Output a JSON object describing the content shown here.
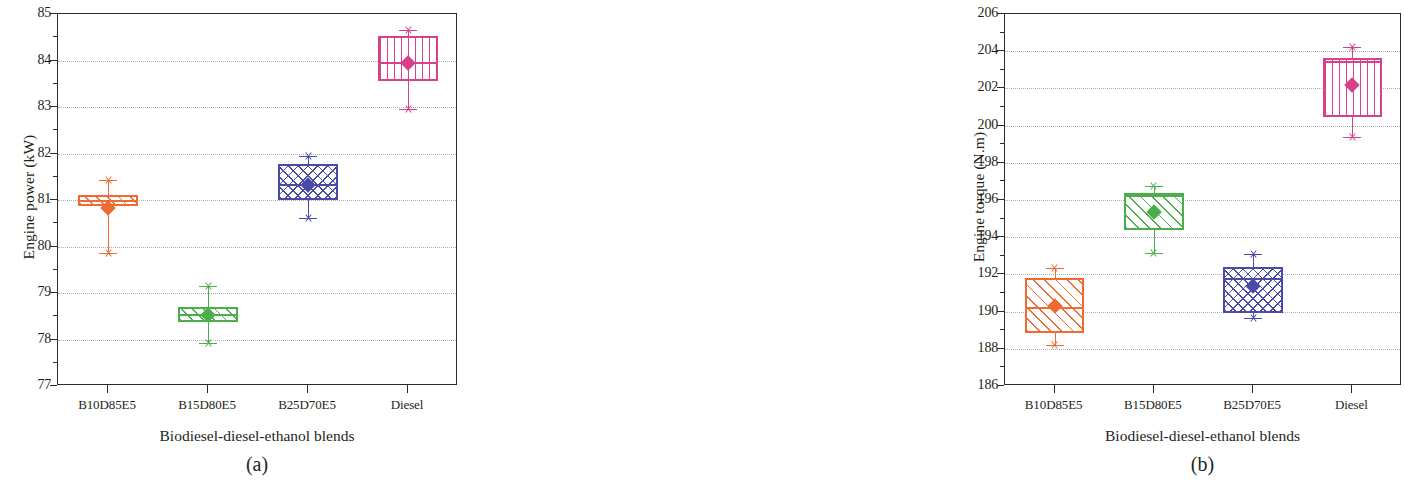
{
  "figure": {
    "panels": [
      {
        "caption": "(a)",
        "xlabel": "Biodiesel-diesel-ethanol blends",
        "ylabel": "Engine power (kW)"
      },
      {
        "caption": "(b)",
        "xlabel": "Biodiesel-diesel-ethanol blends",
        "ylabel": "Engine torque (N.m)"
      }
    ]
  },
  "colors": {
    "orange": "#ee6b33",
    "green": "#4aaf4a",
    "blue": "#4a4aa8",
    "pink": "#d6418a",
    "axis": "#2b2b2b",
    "grid": "#9aa3ad"
  },
  "chart_data": [
    {
      "type": "box",
      "title": "(a)",
      "xlabel": "Biodiesel-diesel-ethanol blends",
      "ylabel": "Engine power (kW)",
      "ylim": [
        77,
        85
      ],
      "yticks": [
        77,
        78,
        79,
        80,
        81,
        82,
        83,
        84,
        85
      ],
      "ytick_labels": [
        "77",
        "78",
        "79",
        "80",
        "81",
        "82",
        "83",
        "84",
        "85"
      ],
      "grid": true,
      "legend": "none",
      "categories": [
        "B10D85E5",
        "B15D80E5",
        "B25D70E5",
        "Diesel"
      ],
      "boxes": [
        {
          "category": "B10D85E5",
          "color": "#ee6b33",
          "hatch": "diagonal-right",
          "whisker_low": 79.85,
          "q1": 80.88,
          "median": 81.0,
          "mean": 80.82,
          "q3": 81.1,
          "whisker_high": 81.43
        },
        {
          "category": "B15D80E5",
          "color": "#4aaf4a",
          "hatch": "diagonal-right",
          "whisker_low": 77.92,
          "q1": 78.37,
          "median": 78.55,
          "mean": 78.53,
          "q3": 78.69,
          "whisker_high": 79.14
        },
        {
          "category": "B25D70E5",
          "color": "#4a4aa8",
          "hatch": "crosshatch",
          "whisker_low": 80.62,
          "q1": 81.0,
          "median": 81.35,
          "mean": 81.32,
          "q3": 81.77,
          "whisker_high": 81.95
        },
        {
          "category": "Diesel",
          "color": "#d6418a",
          "hatch": "vertical",
          "whisker_low": 82.96,
          "q1": 83.55,
          "median": 83.97,
          "mean": 83.95,
          "q3": 84.52,
          "whisker_high": 84.66
        }
      ]
    },
    {
      "type": "box",
      "title": "(b)",
      "xlabel": "Biodiesel-diesel-ethanol blends",
      "ylabel": "Engine torque (N.m)",
      "ylim": [
        186,
        206
      ],
      "yticks": [
        186,
        188,
        190,
        192,
        194,
        196,
        198,
        200,
        202,
        204,
        206
      ],
      "ytick_labels": [
        "186",
        "188",
        "190",
        "192",
        "194",
        "196",
        "198",
        "200",
        "202",
        "204",
        "206"
      ],
      "grid": true,
      "legend": "none",
      "categories": [
        "B10D85E5",
        "B15D80E5",
        "B25D70E5",
        "Diesel"
      ],
      "boxes": [
        {
          "category": "B10D85E5",
          "color": "#ee6b33",
          "hatch": "diagonal-right",
          "whisker_low": 188.2,
          "q1": 188.85,
          "median": 190.25,
          "mean": 190.28,
          "q3": 191.8,
          "whisker_high": 192.35
        },
        {
          "category": "B15D80E5",
          "color": "#4aaf4a",
          "hatch": "diagonal-right",
          "whisker_low": 193.15,
          "q1": 194.4,
          "median": 196.25,
          "mean": 195.35,
          "q3": 196.35,
          "whisker_high": 196.75
        },
        {
          "category": "B25D70E5",
          "color": "#4a4aa8",
          "hatch": "crosshatch",
          "whisker_low": 189.65,
          "q1": 189.95,
          "median": 191.8,
          "mean": 191.35,
          "q3": 192.4,
          "whisker_high": 193.1
        },
        {
          "category": "Diesel",
          "color": "#d6418a",
          "hatch": "vertical",
          "whisker_low": 199.4,
          "q1": 200.45,
          "median": 203.5,
          "mean": 202.2,
          "q3": 203.65,
          "whisker_high": 204.2
        }
      ]
    }
  ]
}
